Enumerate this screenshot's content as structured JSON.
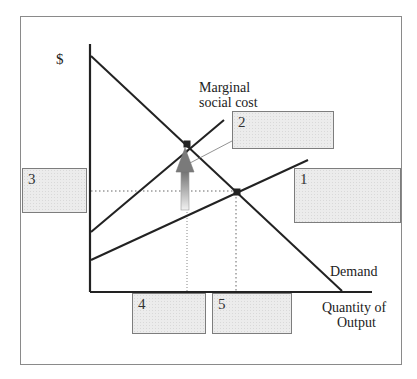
{
  "diagram": {
    "y_axis_label": "$",
    "x_axis_label_line1": "Quantity of",
    "x_axis_label_line2": "Output",
    "curves": {
      "demand": {
        "label": "Demand",
        "from": [
          91,
          56
        ],
        "to": [
          342,
          291
        ]
      },
      "marginal_social_cost": {
        "label_line1": "Marginal",
        "label_line2": "social cost",
        "from": [
          91,
          232
        ],
        "to": [
          224,
          120
        ]
      },
      "private_marginal_cost": {
        "label": "",
        "from": [
          91,
          260
        ],
        "to": [
          308,
          160
        ]
      }
    },
    "points": {
      "social_optimum": [
        187,
        144
      ],
      "market_equilibrium": [
        237,
        192
      ]
    },
    "answer_boxes": [
      {
        "id": "1",
        "label": "1"
      },
      {
        "id": "2",
        "label": "2"
      },
      {
        "id": "3",
        "label": "3"
      },
      {
        "id": "4",
        "label": "4"
      },
      {
        "id": "5",
        "label": "5"
      }
    ],
    "colors": {
      "line": "#222222",
      "dotted": "#666666",
      "box_fill": "#ececec",
      "box_border": "#7d7d7d",
      "frame": "#8a8a8a"
    }
  }
}
